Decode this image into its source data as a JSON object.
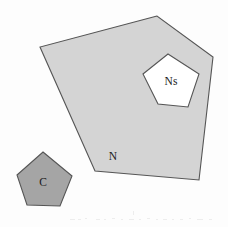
{
  "figure": {
    "background_color": "#fdfdfd",
    "width": 228,
    "height": 227
  },
  "palette": {
    "region_n_fill": "#d4d4d4",
    "region_ns_fill": "#ffffff",
    "region_c_fill": "#a5a5a5",
    "outline": "#555555",
    "label_color": "#1a1a1a",
    "background": "#fdfdfd"
  },
  "shapes": [
    {
      "id": "region-n",
      "label": "N",
      "role": "outer-region",
      "fill": "#d4d4d4",
      "stroke": "#555555",
      "stroke_width": 1.1,
      "points": "157,16 40,47 95,171 199,180 213,57",
      "label_x": 113,
      "label_y": 160
    },
    {
      "id": "region-ns",
      "label": "Ns",
      "role": "inner-hole-region",
      "fill": "#ffffff",
      "stroke": "#555555",
      "stroke_width": 1.1,
      "points": "168,54 199,74 188,107 158,104 143,74",
      "label_x": 170,
      "label_y": 85
    },
    {
      "id": "region-c",
      "label": "C",
      "role": "separate-region",
      "fill": "#a5a5a5",
      "stroke": "#555555",
      "stroke_width": 1.1,
      "points": "43,152 72,176 60,206 27,205 17,175",
      "label_x": 43,
      "label_y": 186
    }
  ],
  "labels": {
    "n": "N",
    "ns": "Ns",
    "c": "C"
  }
}
